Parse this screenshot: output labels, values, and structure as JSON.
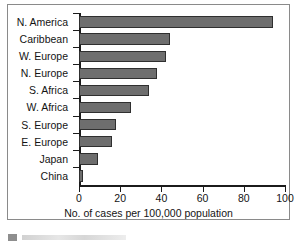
{
  "chart_data": {
    "type": "bar",
    "orientation": "horizontal",
    "title": "",
    "xlabel": "No. of cases per 100,000 population",
    "ylabel": "",
    "xlim": [
      0,
      100
    ],
    "xticks": [
      0,
      20,
      40,
      60,
      80,
      100
    ],
    "grid": false,
    "legend": null,
    "bar_color": "#6e6e6e",
    "bar_edge_color": "#2f2f2f",
    "categories": [
      "N. America",
      "Caribbean",
      "W. Europe",
      "N. Europe",
      "S. Africa",
      "W. Africa",
      "S. Europe",
      "E. Europe",
      "Japan",
      "China"
    ],
    "values": [
      94,
      44,
      42,
      38,
      34,
      25,
      18,
      16,
      9,
      2
    ]
  }
}
